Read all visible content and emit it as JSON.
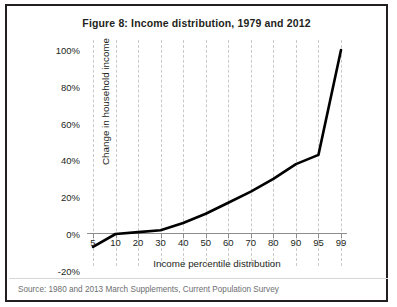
{
  "figure": {
    "title": "Figure 8: Income distribution, 1979 and 2012",
    "source": "Source: 1980 and 2013 March Supplements, Current Population Survey"
  },
  "chart_data": {
    "type": "line",
    "title": "Figure 8: Income distribution, 1979 and 2012",
    "xlabel": "Income percentile distribution",
    "ylabel": "Change in household income",
    "categories": [
      "5",
      "10",
      "20",
      "30",
      "40",
      "50",
      "60",
      "70",
      "80",
      "90",
      "95",
      "99"
    ],
    "values": [
      -7,
      0,
      1,
      2,
      6,
      11,
      17,
      23,
      30,
      38,
      43,
      100
    ],
    "ytick_labels": [
      "100%",
      "80%",
      "60%",
      "40%",
      "20%",
      "0%",
      "-20%"
    ],
    "ytick_values": [
      100,
      80,
      60,
      40,
      20,
      0,
      -20
    ],
    "ylim": [
      -20,
      100
    ],
    "grid": "vertical-dashed",
    "legend": "none",
    "series": [
      {
        "name": "Change in household income, 1979 to 2012",
        "values": [
          -7,
          0,
          1,
          2,
          6,
          11,
          17,
          23,
          30,
          38,
          43,
          100
        ]
      }
    ]
  }
}
